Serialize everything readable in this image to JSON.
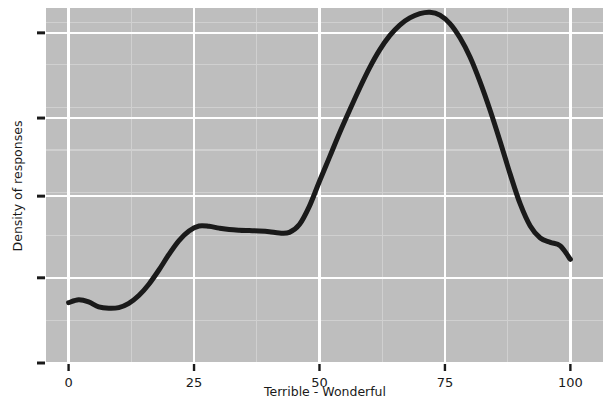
{
  "chart_data": {
    "type": "line",
    "title": "",
    "subtitle": "",
    "xlabel": "Terrible - Wonderful",
    "ylabel": "Density of responses",
    "xlim": [
      -4.5,
      106.5
    ],
    "ylim": [
      0,
      1.0
    ],
    "xticks": [
      0,
      25,
      50,
      75,
      100
    ],
    "xticklabels": [
      "0",
      "25",
      "50",
      "75",
      "100"
    ],
    "yticks": [
      0.0,
      0.24,
      0.47,
      0.69,
      0.93
    ],
    "yticklabels": [
      "",
      "",
      "",
      "",
      ""
    ],
    "grid": true,
    "grid_color": "#FFFFFF",
    "minor_grid": true,
    "minor_grid_color": "#D0D0D0",
    "panel_background": "#BEBEBE",
    "figure_background": "#FFFFFF",
    "line_color": "#1A1A1A",
    "line_width": 5,
    "legend": null,
    "legend_position": "none",
    "series": [
      {
        "name": "Density of responses",
        "x": [
          0,
          2,
          4,
          6,
          8,
          10,
          12,
          14,
          16,
          18,
          20,
          22,
          24,
          26,
          28,
          30,
          32,
          34,
          36,
          38,
          40,
          42,
          44,
          46,
          48,
          50,
          52,
          54,
          56,
          58,
          60,
          62,
          64,
          66,
          68,
          70,
          72,
          74,
          76,
          78,
          80,
          82,
          84,
          86,
          88,
          90,
          92,
          94,
          96,
          98,
          100
        ],
        "y": [
          0.17,
          0.178,
          0.172,
          0.158,
          0.154,
          0.156,
          0.168,
          0.19,
          0.222,
          0.262,
          0.306,
          0.345,
          0.372,
          0.386,
          0.385,
          0.38,
          0.376,
          0.374,
          0.373,
          0.372,
          0.37,
          0.366,
          0.368,
          0.39,
          0.442,
          0.512,
          0.58,
          0.648,
          0.712,
          0.774,
          0.832,
          0.882,
          0.922,
          0.952,
          0.972,
          0.984,
          0.988,
          0.98,
          0.956,
          0.916,
          0.862,
          0.792,
          0.712,
          0.624,
          0.532,
          0.448,
          0.386,
          0.352,
          0.34,
          0.33,
          0.292
        ]
      }
    ]
  },
  "axes": {
    "x_title": "Terrible - Wonderful",
    "y_title": "Density of responses",
    "x_tick_labels": [
      "0",
      "25",
      "50",
      "75",
      "100"
    ]
  }
}
